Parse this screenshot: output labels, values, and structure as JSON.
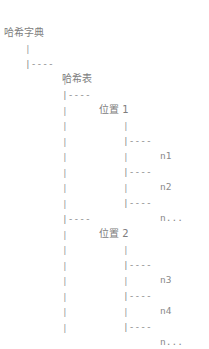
{
  "diagram": {
    "title": "哈希字典",
    "type": "ascii-tree",
    "background_color": "#ffffff",
    "text_color": "#8a8a8a",
    "connector": "|----",
    "pipe": "|",
    "columns": {
      "root_x": 4,
      "level1_x": 25,
      "level2_x": 62,
      "level3_x": 123,
      "label_offset": 30
    },
    "line_height": 15,
    "nodes": {
      "root": "哈希字典",
      "hash_table": "哈希表",
      "slot_1": "位置 1",
      "slot_2": "位置 2",
      "n1": "n1",
      "n2": "n2",
      "n_more_1": "n...",
      "n3": "n3",
      "n4": "n4",
      "n_more_2": "n..."
    },
    "rows": [
      {
        "y": 10,
        "root_label": "哈希字典"
      },
      {
        "y": 26,
        "pipe1": "|"
      },
      {
        "y": 41,
        "branch1": "|----",
        "hash_table_label": "哈希表"
      },
      {
        "y": 57,
        "pipe2": "|"
      },
      {
        "y": 72,
        "branch2": "|----",
        "slot1_label": "位置 1"
      },
      {
        "y": 88,
        "pipe2b": "|",
        "pipe3": "|"
      },
      {
        "y": 103,
        "pipe2c": "|",
        "branch3": "|----",
        "leaf": "n1"
      },
      {
        "y": 119,
        "pipe2d": "|",
        "pipe3b": "|"
      },
      {
        "y": 134,
        "pipe2e": "|",
        "branch3b": "|----",
        "leaf": "n2"
      },
      {
        "y": 150,
        "pipe2f": "|",
        "pipe3c": "|"
      },
      {
        "y": 165,
        "pipe2g": "|",
        "branch3c": "|----",
        "leaf": "n..."
      },
      {
        "y": 181,
        "pipe2h": "|"
      },
      {
        "y": 196,
        "branch2b": "|----",
        "slot2_label": "位置 2"
      },
      {
        "y": 212,
        "pipe2i": "|",
        "pipe3d": "|"
      },
      {
        "y": 227,
        "pipe2j": "|",
        "branch3d": "|----",
        "leaf": "n3"
      },
      {
        "y": 243,
        "pipe2k": "|",
        "pipe3e": "|"
      },
      {
        "y": 258,
        "pipe2l": "|",
        "branch3e": "|----",
        "leaf": "n4"
      },
      {
        "y": 274,
        "pipe2m": "|",
        "pipe3f": "|"
      },
      {
        "y": 289,
        "pipe2n": "|",
        "branch3f": "|----",
        "leaf": "n..."
      },
      {
        "y": 305,
        "pipe2o": "|"
      }
    ]
  }
}
